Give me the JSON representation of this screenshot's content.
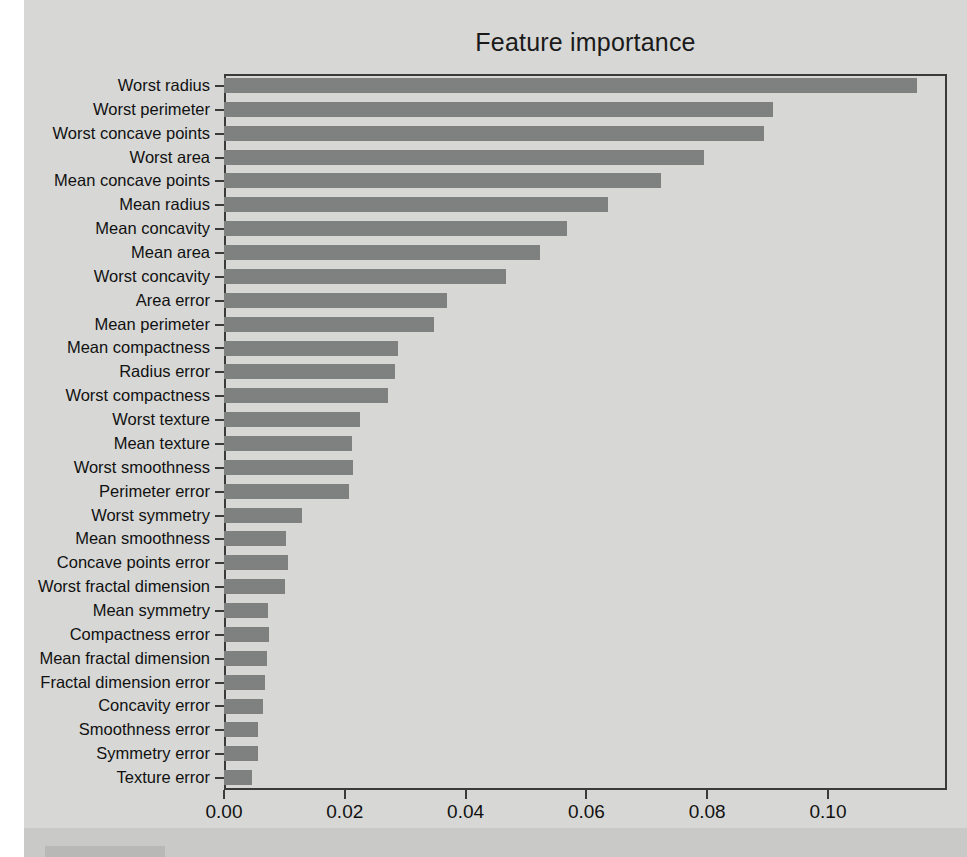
{
  "figure": {
    "title": "Feature importance"
  },
  "chart_data": {
    "type": "bar",
    "orientation": "horizontal",
    "title": "Feature importance",
    "xlabel": "",
    "ylabel": "",
    "xlim": [
      0.0,
      0.1197
    ],
    "grid": false,
    "legend": null,
    "bar_color": "#7f8080",
    "background_color": "#d7d8d6",
    "xticks": [
      "0.00",
      "0.02",
      "0.04",
      "0.06",
      "0.08",
      "0.10"
    ],
    "xtick_values": [
      0.0,
      0.02,
      0.04,
      0.06,
      0.08,
      0.1
    ],
    "categories": [
      "Worst radius",
      "Worst perimeter",
      "Worst concave points",
      "Worst area",
      "Mean concave points",
      "Mean radius",
      "Mean concavity",
      "Mean area",
      "Worst concavity",
      "Area error",
      "Mean perimeter",
      "Mean compactness",
      "Radius error",
      "Worst compactness",
      "Worst texture",
      "Mean texture",
      "Worst smoothness",
      "Perimeter error",
      "Worst symmetry",
      "Mean smoothness",
      "Concave points error",
      "Worst fractal dimension",
      "Mean symmetry",
      "Compactness error",
      "Mean fractal dimension",
      "Fractal dimension error",
      "Concavity error",
      "Smoothness error",
      "Symmetry error",
      "Texture error"
    ],
    "values": [
      0.1147,
      0.0909,
      0.0894,
      0.0795,
      0.0724,
      0.0636,
      0.0568,
      0.0523,
      0.0467,
      0.0369,
      0.0348,
      0.0288,
      0.0283,
      0.0272,
      0.0225,
      0.0212,
      0.0213,
      0.0207,
      0.0129,
      0.0103,
      0.0106,
      0.0101,
      0.0073,
      0.0075,
      0.0071,
      0.0068,
      0.0064,
      0.0056,
      0.0056,
      0.0046
    ]
  }
}
